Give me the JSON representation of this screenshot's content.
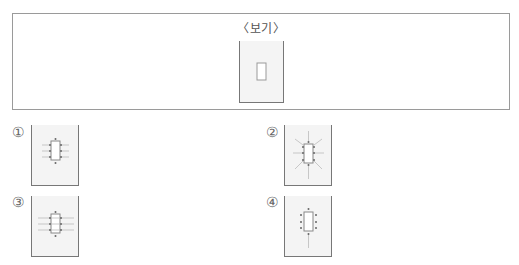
{
  "example": {
    "title": "〈보기〉",
    "description": "beaker containing a rectangular object"
  },
  "options": [
    {
      "number": "①",
      "pattern": "short horizontal lines at side dots, dots top/bottom"
    },
    {
      "number": "②",
      "pattern": "radiating lines outward in all directions including diagonals"
    },
    {
      "number": "③",
      "pattern": "long horizontal lines through side dots"
    },
    {
      "number": "④",
      "pattern": "dots around rectangle with vertical line below"
    }
  ],
  "colors": {
    "border": "#9a9a9a",
    "beaker_wall": "#777777",
    "beaker_fill": "#f4f4f4",
    "object": "#888888"
  }
}
